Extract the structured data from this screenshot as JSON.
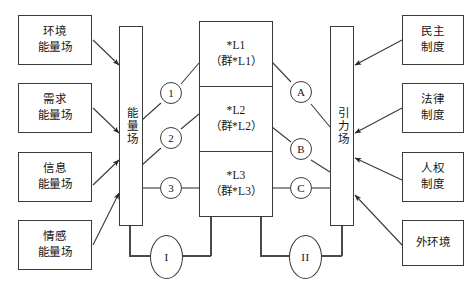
{
  "diagram": {
    "stroke_color": "#3a3a3a",
    "text_color": "#161616",
    "background": "#ffffff",
    "left_inputs": [
      {
        "id": "env",
        "line1": "环境",
        "line2": "能量场"
      },
      {
        "id": "demand",
        "line1": "需求",
        "line2": "能量场"
      },
      {
        "id": "info",
        "line1": "信息",
        "line2": "能量场"
      },
      {
        "id": "emotion",
        "line1": "情感",
        "line2": "能量场"
      }
    ],
    "left_bar": {
      "label": "能量场"
    },
    "left_circles": [
      {
        "id": "c1",
        "label": "1"
      },
      {
        "id": "c2",
        "label": "2"
      },
      {
        "id": "c3",
        "label": "3"
      }
    ],
    "center_cells": [
      {
        "id": "l1",
        "line1": "*L1",
        "line2": "（群*L1）"
      },
      {
        "id": "l2",
        "line1": "*L2",
        "line2": "（群*L2）"
      },
      {
        "id": "l3",
        "line1": "*L3",
        "line2": "（群*L3）"
      }
    ],
    "right_circles": [
      {
        "id": "ca",
        "label": "A"
      },
      {
        "id": "cb",
        "label": "B"
      },
      {
        "id": "cc",
        "label": "C"
      }
    ],
    "right_bar": {
      "label": "引力场"
    },
    "right_inputs": [
      {
        "id": "democracy",
        "line1": "民主",
        "line2": "制度"
      },
      {
        "id": "law",
        "line1": "法律",
        "line2": "制度"
      },
      {
        "id": "rights",
        "line1": "人权",
        "line2": "制度"
      },
      {
        "id": "external",
        "line1": "外环境",
        "line2": ""
      }
    ],
    "feedback_loops": [
      {
        "id": "loop1",
        "label": "I"
      },
      {
        "id": "loop2",
        "label": "II"
      }
    ]
  }
}
